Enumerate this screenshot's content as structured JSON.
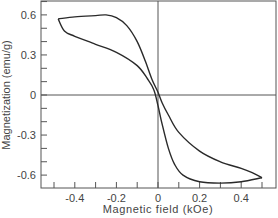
{
  "chart_data": {
    "type": "line",
    "title": "",
    "xlabel": "Magnetic field (kOe)",
    "ylabel": "Magnetization (emu/g)",
    "xlim": [
      -0.52,
      0.56
    ],
    "ylim": [
      -0.71,
      0.7
    ],
    "grid": false,
    "legend": null,
    "x_ticks": [
      -0.4,
      -0.2,
      0,
      0.2,
      0.4
    ],
    "x_tick_labels": [
      "-0.4",
      "-0.2",
      "0",
      "0.2",
      "0.4"
    ],
    "x_minor_step": 0.1,
    "y_ticks": [
      0.6,
      0.3,
      0,
      -0.3,
      -0.6
    ],
    "y_tick_labels": [
      "0.6",
      "0.3",
      "0",
      "-0.3",
      "-0.6"
    ],
    "y_minor_step": 0.1,
    "zero_lines": true,
    "series": [
      {
        "name": "descending branch (upper)",
        "x": [
          -0.48,
          -0.4,
          -0.3,
          -0.25,
          -0.2,
          -0.15,
          -0.1,
          -0.06,
          -0.03,
          0.0,
          0.02,
          0.05,
          0.1,
          0.2,
          0.3,
          0.4,
          0.45,
          0.5
        ],
        "y": [
          0.57,
          0.585,
          0.595,
          0.6,
          0.58,
          0.52,
          0.4,
          0.25,
          0.12,
          0.02,
          -0.06,
          -0.15,
          -0.28,
          -0.42,
          -0.5,
          -0.55,
          -0.58,
          -0.62
        ]
      },
      {
        "name": "ascending branch (lower)",
        "x": [
          0.5,
          0.4,
          0.3,
          0.2,
          0.12,
          0.08,
          0.05,
          0.02,
          0.0,
          -0.02,
          -0.05,
          -0.1,
          -0.2,
          -0.3,
          -0.4,
          -0.45,
          -0.48
        ],
        "y": [
          -0.62,
          -0.65,
          -0.66,
          -0.65,
          -0.6,
          -0.52,
          -0.4,
          -0.22,
          -0.08,
          0.04,
          0.12,
          0.22,
          0.32,
          0.38,
          0.44,
          0.48,
          0.57
        ]
      }
    ]
  }
}
